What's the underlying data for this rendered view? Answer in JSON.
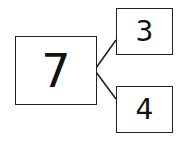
{
  "number_bond": {
    "whole": "7",
    "parts": [
      "3",
      "4"
    ]
  },
  "colors": {
    "stroke": "#222222",
    "background": "#ffffff"
  }
}
